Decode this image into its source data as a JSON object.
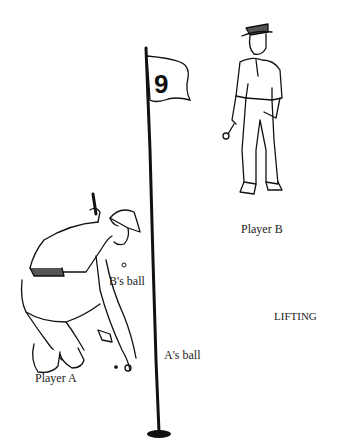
{
  "flag": {
    "number": "9"
  },
  "labels": {
    "player_a": "Player A",
    "player_b": "Player B",
    "b_ball": "B's ball",
    "a_ball": "A's ball",
    "title": "LIFTING"
  }
}
